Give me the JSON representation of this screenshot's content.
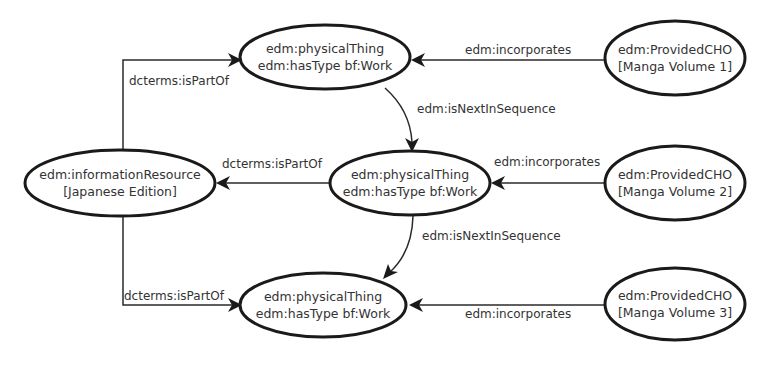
{
  "diagram": {
    "nodes": {
      "work1": {
        "line1": "edm:physicalThing",
        "line2": "edm:hasType bf:Work"
      },
      "work2": {
        "line1": "edm:physicalThing",
        "line2": "edm:hasType bf:Work"
      },
      "work3": {
        "line1": "edm:physicalThing",
        "line2": "edm:hasType bf:Work"
      },
      "edition": {
        "line1": "edm:informationResource",
        "line2": "[Japanese Edition]"
      },
      "cho1": {
        "line1": "edm:ProvidedCHO",
        "line2": "[Manga Volume 1]"
      },
      "cho2": {
        "line1": "edm:ProvidedCHO",
        "line2": "[Manga Volume 2]"
      },
      "cho3": {
        "line1": "edm:ProvidedCHO",
        "line2": "[Manga Volume 3]"
      }
    },
    "edges": {
      "partof_top": "dcterms:isPartOf",
      "partof_mid": "dcterms:isPartOf",
      "partof_bottom": "dcterms:isPartOf",
      "incorporates1": "edm:incorporates",
      "incorporates2": "edm:incorporates",
      "incorporates3": "edm:incorporates",
      "next1": "edm:isNextInSequence",
      "next2": "edm:isNextInSequence"
    },
    "colors": {
      "stroke": "#1a1a1a",
      "text": "#333333",
      "background": "#ffffff"
    }
  }
}
